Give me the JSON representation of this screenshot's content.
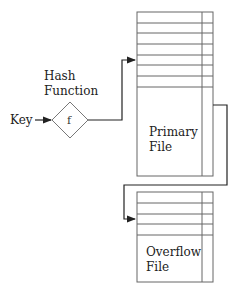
{
  "diagram": {
    "key_label": "Key",
    "hash_function_label_line1": "Hash",
    "hash_function_label_line2": "Function",
    "function_symbol": "f",
    "primary_file": {
      "label_line1": "Primary",
      "label_line2": "File",
      "bucket_rows": 7
    },
    "overflow_file": {
      "label_line1": "Overflow",
      "label_line2": "File",
      "bucket_rows": 4
    },
    "colors": {
      "line": "#555555",
      "connector": "#222222",
      "text": "#222222"
    }
  }
}
